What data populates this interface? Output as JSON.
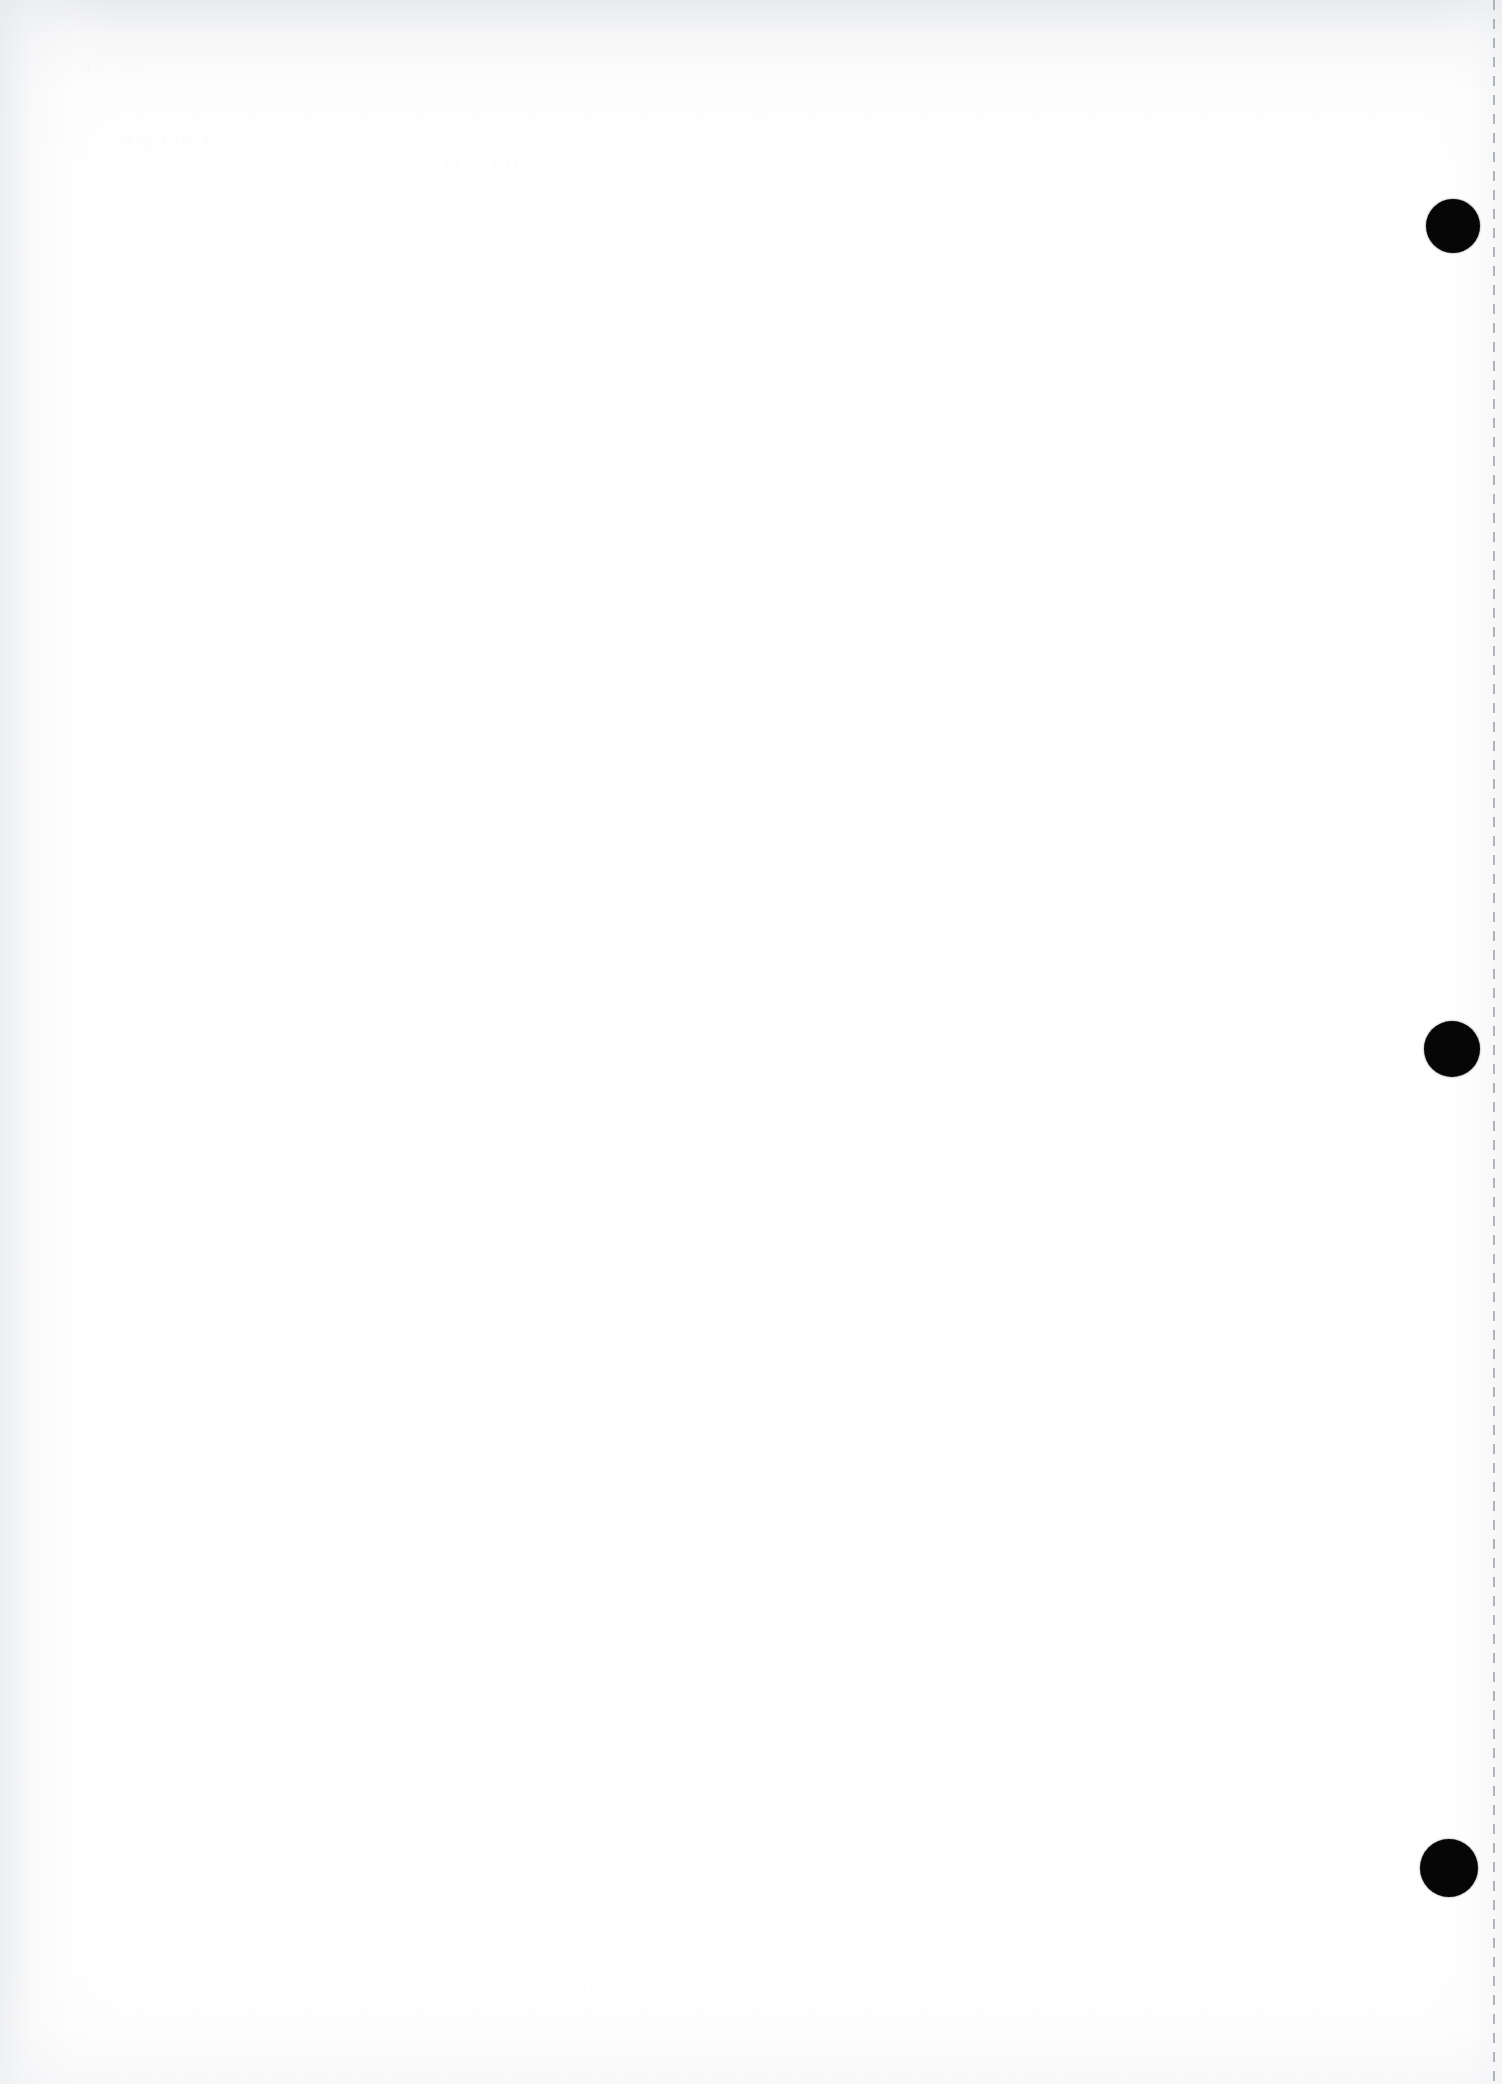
{
  "page": {
    "kind": "scanned-blank-page",
    "width": 1502,
    "height": 2084,
    "background_color": "#ffffff",
    "visible_text": "",
    "description_label": ""
  },
  "marks": {
    "punch_holes": [
      {
        "name": "punch-hole-top",
        "cx": 1453,
        "cy": 226,
        "r": 27,
        "color": "#060606"
      },
      {
        "name": "punch-hole-middle",
        "cx": 1452,
        "cy": 1049,
        "r": 28,
        "color": "#060606"
      },
      {
        "name": "punch-hole-bottom",
        "cx": 1449,
        "cy": 1868,
        "r": 29,
        "color": "#060606"
      }
    ],
    "perforation_line": {
      "name": "perforation-line",
      "x": 1493,
      "color": "#b0b3b9",
      "dash_length": 10,
      "gap_length": 9,
      "thickness": 2
    }
  },
  "ghost_bleed": {
    "line_a": "|| || |  | ||  ||| |",
    "line_b": "||  ||| || |  |||| |||",
    "line_c": "| ||  ||| |  ||  | ||| |  ||",
    "line_d": "|| | ||| |  ||",
    "line_e": "||| | ||  |  |"
  },
  "shading": {
    "top_edge_color": "#e4e6e9",
    "left_edge_color": "#e8eaec",
    "right_edge_color": "#eeeff1",
    "bottom_edge_color": "#f2f3f5"
  }
}
